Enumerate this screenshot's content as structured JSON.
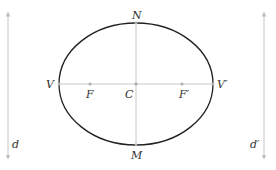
{
  "diagram": {
    "type": "ellipse-with-foci-and-directrices",
    "colors": {
      "ellipse": "#222222",
      "axes": "#c8c8c8",
      "directrix": "#c0c0c0",
      "label": "#333333",
      "point": "#b0b0b0"
    },
    "ellipse": {
      "center": [
        136,
        84
      ],
      "rx": 77,
      "ry": 61
    },
    "labels": {
      "N": "N",
      "M": "M",
      "V": "V",
      "V_prime": "V′",
      "F": "F",
      "F_prime": "F′",
      "C": "C",
      "d": "d",
      "d_prime": "d′"
    },
    "points": {
      "N": [
        136,
        23
      ],
      "M": [
        136,
        145
      ],
      "V": [
        59,
        84
      ],
      "V_prime": [
        213,
        84
      ],
      "F": [
        90,
        84
      ],
      "F_prime": [
        182,
        84
      ],
      "C": [
        136,
        84
      ]
    },
    "directrices": [
      {
        "name": "d",
        "x": 8,
        "y_top": 12,
        "y_bottom": 158
      },
      {
        "name": "d′",
        "x": 264,
        "y_top": 12,
        "y_bottom": 158
      }
    ]
  }
}
